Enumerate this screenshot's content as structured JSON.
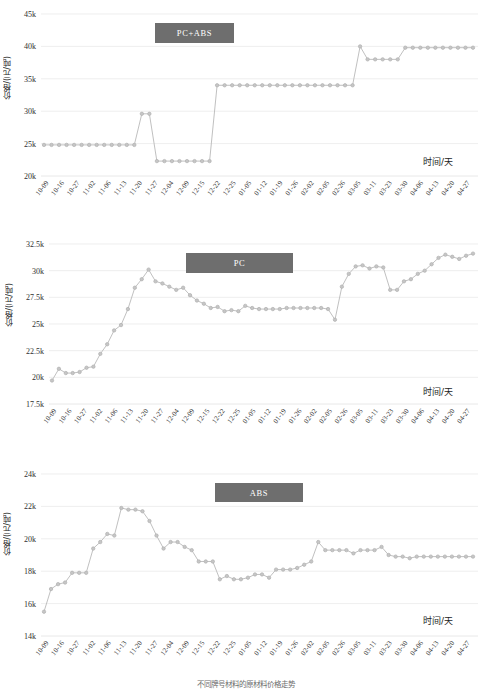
{
  "colors": {
    "legend_bg": "#6e6e6e",
    "legend_text": "#ffffff",
    "series_line": "#b9b9b9",
    "series_marker": "#b0b0b0",
    "grid": "#e2e2e2",
    "text": "#2f2f2f"
  },
  "axis": {
    "x_title": "时间/天",
    "y_title": "价格/(元/吨)",
    "categories": [
      "10-09",
      "10-16",
      "10-27",
      "11-02",
      "11-06",
      "11-13",
      "11-20",
      "11-27",
      "12-04",
      "12-09",
      "12-15",
      "12-22",
      "12-25",
      "01-05",
      "01-12",
      "01-19",
      "01-26",
      "02-02",
      "02-05",
      "02-26",
      "03-05",
      "03-11",
      "03-23",
      "03-30",
      "04-06",
      "04-13",
      "04-20",
      "04-27"
    ]
  },
  "chart_data": [
    {
      "type": "line",
      "id": "pcabs",
      "title": "PC+ABS",
      "legend_label": "PC+ABS",
      "legend_position": "top-center-left",
      "xlabel": "时间/天",
      "ylabel": "价格/(元/吨)",
      "grid": true,
      "ylim": [
        20000,
        45000
      ],
      "yticks": [
        20000,
        25000,
        30000,
        35000,
        40000,
        45000
      ],
      "ytick_labels": [
        "20k",
        "25k",
        "30k",
        "35k",
        "40k",
        "45k"
      ],
      "x": [
        "10-09",
        "10-12",
        "10-16",
        "10-20",
        "10-23",
        "10-27",
        "10-30",
        "11-02",
        "11-04",
        "11-06",
        "11-09",
        "11-13",
        "11-16",
        "11-20",
        "11-23",
        "11-27",
        "11-30",
        "12-04",
        "12-07",
        "12-09",
        "12-12",
        "12-15",
        "12-18",
        "12-22",
        "12-24",
        "12-25",
        "12-29",
        "01-02",
        "01-05",
        "01-08",
        "01-12",
        "01-15",
        "01-19",
        "01-22",
        "01-26",
        "01-29",
        "02-02",
        "02-03",
        "02-05",
        "02-20",
        "02-26",
        "03-02",
        "03-05",
        "03-08",
        "03-11",
        "03-16",
        "03-19",
        "03-23",
        "03-26",
        "03-30",
        "04-02",
        "04-06",
        "04-09",
        "04-13",
        "04-16",
        "04-20",
        "04-23",
        "04-27"
      ],
      "values": [
        24800,
        24800,
        24800,
        24800,
        24800,
        24800,
        24800,
        24800,
        24800,
        24800,
        24800,
        24800,
        24800,
        29600,
        29600,
        22300,
        22300,
        22300,
        22300,
        22300,
        22300,
        22300,
        22300,
        34000,
        34000,
        34000,
        34000,
        34000,
        34000,
        34000,
        34000,
        34000,
        34000,
        34000,
        34000,
        34000,
        34000,
        34000,
        34000,
        34000,
        34000,
        34000,
        40000,
        38000,
        38000,
        38000,
        38000,
        38000,
        39800,
        39800,
        39800,
        39800,
        39800,
        39800,
        39800,
        39800,
        39800,
        39800
      ]
    },
    {
      "type": "line",
      "id": "pc",
      "title": "PC",
      "legend_label": "PC",
      "legend_position": "top-center",
      "xlabel": "时间/天",
      "ylabel": "价格/(元/吨)",
      "grid": true,
      "ylim": [
        17500,
        32500
      ],
      "yticks": [
        17500,
        20000,
        22500,
        25000,
        27500,
        30000,
        32500
      ],
      "ytick_labels": [
        "17.5k",
        "20k",
        "22.5k",
        "25k",
        "27.5k",
        "30k",
        "32.5k"
      ],
      "x": [
        "10-09",
        "10-12",
        "10-16",
        "10-20",
        "10-23",
        "10-27",
        "10-30",
        "11-02",
        "11-04",
        "11-06",
        "11-09",
        "11-13",
        "11-16",
        "11-18",
        "11-20",
        "11-23",
        "11-25",
        "11-27",
        "11-30",
        "12-02",
        "12-04",
        "12-07",
        "12-09",
        "12-12",
        "12-15",
        "12-18",
        "12-22",
        "12-24",
        "12-25",
        "12-29",
        "01-02",
        "01-05",
        "01-08",
        "01-12",
        "01-15",
        "01-19",
        "01-22",
        "01-26",
        "01-29",
        "02-02",
        "02-03",
        "02-05",
        "02-20",
        "02-23",
        "02-26",
        "03-02",
        "03-05",
        "03-08",
        "03-11",
        "03-16",
        "03-19",
        "03-23",
        "03-26",
        "03-30",
        "04-02",
        "04-06",
        "04-09",
        "04-13",
        "04-16",
        "04-20",
        "04-23",
        "04-27"
      ],
      "values": [
        19700,
        20800,
        20400,
        20400,
        20500,
        20900,
        21000,
        22200,
        23100,
        24400,
        24900,
        26400,
        28400,
        29200,
        30100,
        29000,
        28800,
        28500,
        28200,
        28400,
        27700,
        27200,
        26900,
        26500,
        26600,
        26200,
        26300,
        26200,
        26700,
        26500,
        26400,
        26400,
        26400,
        26400,
        26500,
        26500,
        26500,
        26500,
        26500,
        26500,
        26400,
        25400,
        28500,
        29700,
        30400,
        30500,
        30200,
        30400,
        30300,
        28200,
        28200,
        29000,
        29200,
        29700,
        30000,
        30600,
        31200,
        31500,
        31300,
        31100,
        31400,
        31600
      ]
    },
    {
      "type": "line",
      "id": "abs",
      "title": "ABS",
      "legend_label": "ABS",
      "legend_position": "top-center",
      "xlabel": "时间/天",
      "ylabel": "价格/(元/吨)",
      "grid": true,
      "ylim": [
        14000,
        24000
      ],
      "yticks": [
        14000,
        16000,
        18000,
        20000,
        22000,
        24000
      ],
      "ytick_labels": [
        "14k",
        "16k",
        "18k",
        "20k",
        "22k",
        "24k"
      ],
      "x": [
        "10-09",
        "10-12",
        "10-16",
        "10-20",
        "10-23",
        "10-27",
        "10-30",
        "11-02",
        "11-04",
        "11-06",
        "11-09",
        "11-13",
        "11-16",
        "11-18",
        "11-20",
        "11-23",
        "11-25",
        "11-27",
        "11-30",
        "12-02",
        "12-04",
        "12-07",
        "12-09",
        "12-12",
        "12-15",
        "12-18",
        "12-22",
        "12-24",
        "12-25",
        "12-29",
        "01-02",
        "01-05",
        "01-08",
        "01-12",
        "01-15",
        "01-19",
        "01-22",
        "01-26",
        "01-29",
        "02-02",
        "02-03",
        "02-05",
        "02-20",
        "02-23",
        "02-26",
        "03-02",
        "03-05",
        "03-08",
        "03-11",
        "03-16",
        "03-19",
        "03-23",
        "03-26",
        "03-30",
        "04-02",
        "04-06",
        "04-09",
        "04-13",
        "04-16",
        "04-20",
        "04-23",
        "04-27"
      ],
      "values": [
        15500,
        16900,
        17200,
        17300,
        17900,
        17900,
        17900,
        19400,
        19800,
        20300,
        20200,
        21900,
        21800,
        21800,
        21700,
        21100,
        20200,
        19400,
        19800,
        19800,
        19500,
        19300,
        18600,
        18600,
        18600,
        17500,
        17700,
        17500,
        17500,
        17600,
        17800,
        17800,
        17600,
        18100,
        18100,
        18100,
        18200,
        18400,
        18600,
        19800,
        19300,
        19300,
        19300,
        19300,
        19100,
        19300,
        19300,
        19300,
        19500,
        19000,
        18900,
        18900,
        18800,
        18900,
        18900,
        18900,
        18900,
        18900,
        18900,
        18900,
        18900,
        18900
      ]
    }
  ],
  "caption": "不同牌号材料的原材料价格走势"
}
